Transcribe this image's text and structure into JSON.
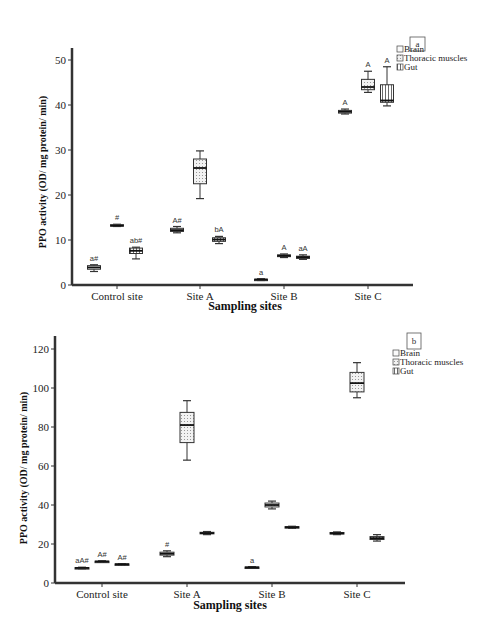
{
  "chart_data": [
    {
      "panel": "a",
      "type": "box",
      "title": "",
      "xlabel": "Sampling sites",
      "ylabel": "PPO activity (OD/ mg protein/ min)",
      "ylim": [
        0,
        50
      ],
      "yticks": [
        0,
        10,
        20,
        30,
        40,
        50
      ],
      "categories": [
        "Control site",
        "Site A",
        "Site B",
        "Site C"
      ],
      "legend": [
        "Brain",
        "Thoracic muscles",
        "Gut"
      ],
      "legend_position": "upper right",
      "grid": false,
      "series": [
        {
          "name": "Brain",
          "boxes": [
            {
              "min": 3.0,
              "q1": 3.5,
              "median": 3.9,
              "q3": 4.3,
              "max": 4.5,
              "annotation": "a#"
            },
            {
              "min": 11.6,
              "q1": 11.9,
              "median": 12.2,
              "q3": 12.6,
              "max": 13.0,
              "annotation": "A#"
            },
            {
              "min": 1.0,
              "q1": 1.1,
              "median": 1.2,
              "q3": 1.3,
              "max": 1.4,
              "annotation": "a"
            },
            {
              "min": 38.0,
              "q1": 38.2,
              "median": 38.5,
              "q3": 38.8,
              "max": 39.1,
              "annotation": "A"
            }
          ]
        },
        {
          "name": "Thoracic muscles",
          "boxes": [
            {
              "min": 13.0,
              "q1": 13.1,
              "median": 13.2,
              "q3": 13.4,
              "max": 13.5,
              "annotation": "#"
            },
            {
              "min": 19.2,
              "q1": 22.5,
              "median": 26.0,
              "q3": 28.0,
              "max": 29.8,
              "annotation": ""
            },
            {
              "min": 6.1,
              "q1": 6.3,
              "median": 6.5,
              "q3": 6.7,
              "max": 6.9,
              "annotation": "A"
            },
            {
              "min": 42.8,
              "q1": 43.4,
              "median": 44.0,
              "q3": 45.7,
              "max": 47.5,
              "annotation": "A"
            }
          ]
        },
        {
          "name": "Gut",
          "boxes": [
            {
              "min": 5.8,
              "q1": 7.0,
              "median": 7.6,
              "q3": 8.2,
              "max": 8.4,
              "annotation": "ab#"
            },
            {
              "min": 9.2,
              "q1": 9.7,
              "median": 10.1,
              "q3": 10.5,
              "max": 10.8,
              "annotation": "bA"
            },
            {
              "min": 5.7,
              "q1": 5.9,
              "median": 6.2,
              "q3": 6.4,
              "max": 6.7,
              "annotation": "aA"
            },
            {
              "min": 39.8,
              "q1": 40.6,
              "median": 41.0,
              "q3": 44.5,
              "max": 48.5,
              "annotation": "A"
            }
          ]
        }
      ]
    },
    {
      "panel": "b",
      "type": "box",
      "title": "",
      "xlabel": "Sampling sites",
      "ylabel": "PPO activity (OD/ mg protein/ min)",
      "ylim": [
        0,
        125
      ],
      "yticks": [
        0,
        20,
        40,
        60,
        80,
        100,
        120
      ],
      "categories": [
        "Control site",
        "Site A",
        "Site B",
        "Site C"
      ],
      "legend": [
        "Brain",
        "Thoracic muscles",
        "Gut"
      ],
      "legend_position": "upper right",
      "grid": false,
      "series": [
        {
          "name": "Brain",
          "boxes": [
            {
              "min": 7.3,
              "q1": 7.5,
              "median": 7.7,
              "q3": 7.9,
              "max": 8.1,
              "annotation": "aA#"
            },
            {
              "min": 13.5,
              "q1": 14.3,
              "median": 15.0,
              "q3": 15.8,
              "max": 16.5,
              "annotation": "#"
            },
            {
              "min": 7.6,
              "q1": 7.8,
              "median": 8.0,
              "q3": 8.2,
              "max": 8.4,
              "annotation": "a"
            },
            {
              "min": 24.8,
              "q1": 25.1,
              "median": 25.5,
              "q3": 25.9,
              "max": 26.2,
              "annotation": ""
            }
          ]
        },
        {
          "name": "Thoracic muscles",
          "boxes": [
            {
              "min": 10.6,
              "q1": 10.8,
              "median": 11.0,
              "q3": 11.2,
              "max": 11.4,
              "annotation": "A#"
            },
            {
              "min": 63.0,
              "q1": 72.0,
              "median": 81.0,
              "q3": 87.5,
              "max": 93.5,
              "annotation": ""
            },
            {
              "min": 38.0,
              "q1": 39.0,
              "median": 40.0,
              "q3": 41.0,
              "max": 42.0,
              "annotation": ""
            },
            {
              "min": 95.0,
              "q1": 98.0,
              "median": 102.5,
              "q3": 108.0,
              "max": 113.0,
              "annotation": ""
            }
          ]
        },
        {
          "name": "Gut",
          "boxes": [
            {
              "min": 9.3,
              "q1": 9.4,
              "median": 9.6,
              "q3": 9.8,
              "max": 9.9,
              "annotation": "A#"
            },
            {
              "min": 24.8,
              "q1": 25.2,
              "median": 25.6,
              "q3": 26.0,
              "max": 26.4,
              "annotation": ""
            },
            {
              "min": 28.0,
              "q1": 28.3,
              "median": 28.6,
              "q3": 28.9,
              "max": 29.1,
              "annotation": ""
            },
            {
              "min": 21.5,
              "q1": 22.3,
              "median": 23.0,
              "q3": 23.8,
              "max": 24.8,
              "annotation": ""
            }
          ]
        }
      ]
    }
  ],
  "panels": {
    "a": {
      "tag": "a"
    },
    "b": {
      "tag": "b"
    }
  }
}
